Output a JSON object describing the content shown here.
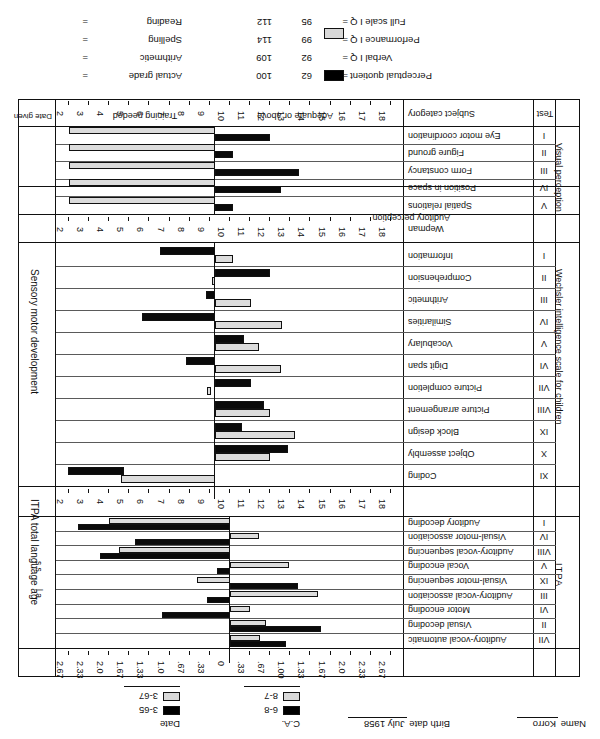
{
  "header": {
    "name_label": "Name",
    "name_value": "Korro",
    "birthdate_label": "Birth date",
    "birthdate_value": "July 1958",
    "ca_label": "C.A.",
    "ca_dark": "6-8",
    "ca_light": "8-7",
    "date_label": "Date",
    "date_dark": "3-65",
    "date_light": "3-67"
  },
  "table": {
    "test_header": "Test",
    "subject_category_header": "Subject category",
    "date_given_header": "Date given",
    "band_adequate": "Adequate or above",
    "band_training": "Training needed"
  },
  "sections": [
    {
      "name": "Visual perception",
      "group_label": "Visual perception",
      "scale_note": "Sensory motor development",
      "rows": [
        {
          "numeral": "I",
          "label": "Eye motor coordination"
        },
        {
          "numeral": "II",
          "label": "Figure ground"
        },
        {
          "numeral": "III",
          "label": "Form constancy"
        },
        {
          "numeral": "IV",
          "label": "Position in space"
        },
        {
          "numeral": "V",
          "label": "Spatial relations"
        }
      ]
    },
    {
      "name": "Auditory perception",
      "group_label": "Auditory perception",
      "rows": [
        {
          "numeral": "",
          "label": "Wepman"
        }
      ]
    },
    {
      "name": "Wechsler intelligence scale for children",
      "group_label": "Wechsler intelligence scale for children",
      "rows": [
        {
          "numeral": "I",
          "label": "Information"
        },
        {
          "numeral": "II",
          "label": "Comprehension"
        },
        {
          "numeral": "III",
          "label": "Arithmetic"
        },
        {
          "numeral": "IV",
          "label": "Similarities"
        },
        {
          "numeral": "V",
          "label": "Vocabulary"
        },
        {
          "numeral": "VI",
          "label": "Digit span"
        },
        {
          "numeral": "VII",
          "label": "Picture completion"
        },
        {
          "numeral": "VIII",
          "label": "Picture arrangement"
        },
        {
          "numeral": "IX",
          "label": "Block design"
        },
        {
          "numeral": "X",
          "label": "Object assembly"
        },
        {
          "numeral": "XI",
          "label": "Coding"
        }
      ]
    },
    {
      "name": "ITPA",
      "group_label": "ITPA",
      "scale_note": "ITPA total language age",
      "rows": [
        {
          "numeral": "VII",
          "label": "Auditory-vocal automatic"
        },
        {
          "numeral": "II",
          "label": "Visual decoding"
        },
        {
          "numeral": "VI",
          "label": "Motor encoding"
        },
        {
          "numeral": "III",
          "label": "Auditory-vocal association"
        },
        {
          "numeral": "IX",
          "label": "Visual-motor sequencing"
        },
        {
          "numeral": "V",
          "label": "Vocal encoding"
        },
        {
          "numeral": "VIII",
          "label": "Auditory-vocal sequencing"
        },
        {
          "numeral": "IV",
          "label": "Visual-motor association"
        },
        {
          "numeral": "I",
          "label": "Auditory decoding"
        }
      ]
    }
  ],
  "axes": {
    "scaled_score_label": "s.s.",
    "language_age_label": "l.a.",
    "wisc_ticks": [
      "18",
      "17",
      "16",
      "15",
      "14",
      "13",
      "12",
      "11",
      "10",
      "9",
      "8",
      "7",
      "6",
      "5",
      "4",
      "3",
      "2"
    ],
    "itpa_ticks": [
      "2.67",
      "2.33",
      "2.0",
      "1.67",
      "1.33",
      "1.00",
      ".67",
      ".33",
      "0",
      ".33",
      ".67",
      "1.0",
      "1.33",
      "1.67",
      "2.0",
      "2.33",
      "2.67"
    ],
    "wisc_mid": "10",
    "itpa_mid": "0"
  },
  "footer": {
    "items": [
      {
        "label": "Perceptual quotient",
        "eq": "=",
        "dark": "62",
        "light": "100"
      },
      {
        "label": "Verbal I Q",
        "eq": "=",
        "dark": "92",
        "light": "109"
      },
      {
        "label": "Performance I Q",
        "eq": "=",
        "dark": "99",
        "light": "114"
      },
      {
        "label": "Full scale I Q",
        "eq": "=",
        "dark": "95",
        "light": "112"
      }
    ],
    "right_items": [
      {
        "label": "Actual grade",
        "eq": "="
      },
      {
        "label": "Arithmetic",
        "eq": "="
      },
      {
        "label": "Spelling",
        "eq": "="
      },
      {
        "label": "Reading",
        "eq": "="
      }
    ]
  },
  "chart_data": {
    "type": "bar",
    "orientation": "horizontal-diverging",
    "series": [
      {
        "name": "3-65 (C.A. 6-8)",
        "color": "#0a0a0a",
        "style": "solid-black"
      },
      {
        "name": "3-67 (C.A. 8-7)",
        "color": "#dcdcdc",
        "style": "stippled-light"
      }
    ],
    "panels": [
      {
        "panel": "Visual perception (Frostig)",
        "xlabel": "Sensory motor development",
        "unit": "scaled score",
        "xlim": [
          2,
          18
        ],
        "xticks": [
          18,
          17,
          16,
          15,
          14,
          13,
          12,
          11,
          10,
          9,
          8,
          7,
          6,
          5,
          4,
          3,
          2
        ],
        "baseline": 10,
        "categories": [
          "Eye motor coordination",
          "Figure ground",
          "Form constancy",
          "Position in space",
          "Spatial relations"
        ],
        "values_dark": [
          13.0,
          11.0,
          14.6,
          13.6,
          11.0
        ],
        "values_light": [
          10.0,
          10.0,
          10.0,
          10.0,
          10.0
        ]
      },
      {
        "panel": "Auditory perception (Wepman)",
        "categories": [
          "Wepman"
        ],
        "values_dark": [
          null
        ],
        "values_light": [
          null
        ]
      },
      {
        "panel": "Wechsler intelligence scale for children",
        "xlabel": "s.s. (scaled score)",
        "unit": "scaled score",
        "xlim": [
          2,
          18
        ],
        "xticks": [
          18,
          17,
          16,
          15,
          14,
          13,
          12,
          11,
          10,
          9,
          8,
          7,
          6,
          5,
          4,
          3,
          2
        ],
        "baseline": 10,
        "categories": [
          "Information",
          "Comprehension",
          "Arithmetic",
          "Similarities",
          "Vocabulary",
          "Digit span",
          "Picture completion",
          "Picture arrangement",
          "Block design",
          "Object assembly",
          "Coding"
        ],
        "values_dark": [
          7.0,
          13.0,
          10.5,
          6.0,
          11.6,
          8.4,
          12.0,
          12.7,
          11.5,
          14.0,
          5.0
        ],
        "values_light": [
          11.0,
          10.0,
          12.0,
          13.7,
          12.4,
          13.6,
          9.8,
          13.0,
          14.4,
          13.0,
          11.6
        ]
      },
      {
        "panel": "ITPA",
        "xlabel": "ITPA total language age",
        "unit": "l.a. deviation (years)",
        "xlim": [
          -2.67,
          2.67
        ],
        "xticks": [
          2.67,
          2.33,
          2.0,
          1.67,
          1.33,
          1.0,
          0.67,
          0.33,
          0,
          -0.33,
          -0.67,
          -1.0,
          -1.33,
          -1.67,
          -2.0,
          -2.33,
          -2.67
        ],
        "baseline": 0,
        "categories": [
          "Auditory-vocal automatic",
          "Visual decoding",
          "Motor encoding",
          "Auditory-vocal association",
          "Visual-motor sequencing",
          "Vocal encoding",
          "Visual-motor sequencing (2)",
          "Auditory-vocal sequencing",
          "Auditory decoding"
        ],
        "values_dark": [
          -0.85,
          -1.4,
          1.05,
          0.35,
          -1.05,
          0.2,
          2.0,
          1.45,
          2.33
        ],
        "values_light": [
          -0.45,
          -0.55,
          -0.3,
          -1.35,
          0.5,
          -0.9,
          1.7,
          -0.45,
          1.85
        ]
      }
    ]
  }
}
